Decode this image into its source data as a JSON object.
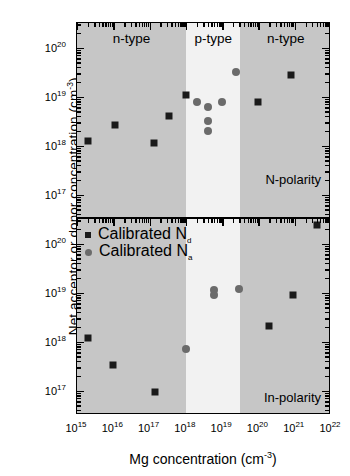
{
  "axes": {
    "x_title_main": "Mg concentration (cm",
    "x_title_sup": "-3",
    "x_title_tail": ")",
    "y_title_main": "Net acceptor or donor concentration (cm",
    "y_title_sup": "-3",
    "y_title_tail": ")",
    "x_ticklabels": [
      "10",
      "10",
      "10",
      "10",
      "10",
      "10",
      "10",
      "10"
    ],
    "x_tickexp": [
      "15",
      "16",
      "17",
      "18",
      "19",
      "20",
      "21",
      "22"
    ],
    "y_ticklabels": [
      "10",
      "10",
      "10",
      "10"
    ],
    "y_tickexp": [
      "20",
      "19",
      "18",
      "17"
    ]
  },
  "legend": {
    "entries": [
      {
        "marker": "square",
        "text": "Calibrated N",
        "sub": "d"
      },
      {
        "marker": "circle",
        "text": "Calibrated N",
        "sub": "a"
      }
    ]
  },
  "panels": [
    {
      "id": "top",
      "polarity_label": "N-polarity",
      "regions": [
        {
          "label": "n-type",
          "type": "dark"
        },
        {
          "label": "p-type",
          "type": "light"
        },
        {
          "label": "n-type",
          "type": "dark"
        }
      ]
    },
    {
      "id": "bottom",
      "polarity_label": "In-polarity",
      "regions": [
        {
          "label": "",
          "type": "dark"
        },
        {
          "label": "",
          "type": "light"
        },
        {
          "label": "",
          "type": "dark"
        }
      ]
    }
  ],
  "chart_data": {
    "type": "scatter",
    "title": "",
    "xlabel": "Mg concentration (cm-3)",
    "ylabel": "Net acceptor or donor concentration (cm-3)",
    "xscale": "log",
    "yscale": "log",
    "xlim": [
      1000000000000000.0,
      1e+22
    ],
    "grid": false,
    "legend_position": "upper-left-of-lower-panel",
    "panels": [
      {
        "name": "N-polarity",
        "ylim": [
          3e+16,
          3e+20
        ],
        "shaded_regions": [
          {
            "label": "n-type",
            "x_range": [
              1000000000000000.0,
              1e+18
            ],
            "shade": "dark"
          },
          {
            "label": "p-type",
            "x_range": [
              1e+18,
              3.2e+19
            ],
            "shade": "light"
          },
          {
            "label": "n-type",
            "x_range": [
              3.2e+19,
              1e+22
            ],
            "shade": "dark"
          }
        ],
        "series": [
          {
            "name": "Calibrated Nd",
            "marker": "square",
            "color": "#1a1a1a",
            "points": [
              {
                "x": 2000000000000000.0,
                "y": 1.25e+18
              },
              {
                "x": 1.1e+16,
                "y": 2.6e+18
              },
              {
                "x": 1.3e+17,
                "y": 1.1e+18
              },
              {
                "x": 3.5e+17,
                "y": 4e+18
              },
              {
                "x": 1e+18,
                "y": 1.05e+19
              },
              {
                "x": 1e+20,
                "y": 7.8e+18
              },
              {
                "x": 8e+20,
                "y": 2.8e+19
              }
            ]
          },
          {
            "name": "Calibrated Na",
            "marker": "circle",
            "color": "#6b6b6b",
            "points": [
              {
                "x": 2e+18,
                "y": 7.8e+18
              },
              {
                "x": 4e+18,
                "y": 6e+18
              },
              {
                "x": 4e+18,
                "y": 3.2e+18
              },
              {
                "x": 4e+18,
                "y": 2e+18
              },
              {
                "x": 1e+19,
                "y": 7.6e+18
              },
              {
                "x": 2.4e+19,
                "y": 3.2e+19
              }
            ]
          }
        ]
      },
      {
        "name": "In-polarity",
        "ylim": [
          3e+16,
          3e+20
        ],
        "shaded_regions": [
          {
            "label": "",
            "x_range": [
              1000000000000000.0,
              1e+18
            ],
            "shade": "dark"
          },
          {
            "label": "",
            "x_range": [
              1e+18,
              3.2e+19
            ],
            "shade": "light"
          },
          {
            "label": "",
            "x_range": [
              3.2e+19,
              1e+22
            ],
            "shade": "dark"
          }
        ],
        "series": [
          {
            "name": "Calibrated Nd",
            "marker": "square",
            "color": "#1a1a1a",
            "points": [
              {
                "x": 2000000000000000.0,
                "y": 1.2e+18
              },
              {
                "x": 1e+16,
                "y": 3.3e+17
              },
              {
                "x": 1.4e+17,
                "y": 9.5e+16
              },
              {
                "x": 2e+20,
                "y": 2.1e+18
              },
              {
                "x": 9e+20,
                "y": 9e+18
              },
              {
                "x": 4e+21,
                "y": 2.4e+20
              }
            ]
          },
          {
            "name": "Calibrated Na",
            "marker": "circle",
            "color": "#6b6b6b",
            "points": [
              {
                "x": 1e+18,
                "y": 7e+17
              },
              {
                "x": 6e+18,
                "y": 9e+18
              },
              {
                "x": 6e+18,
                "y": 1.1e+19
              },
              {
                "x": 3e+19,
                "y": 1.2e+19
              }
            ]
          }
        ]
      }
    ]
  }
}
